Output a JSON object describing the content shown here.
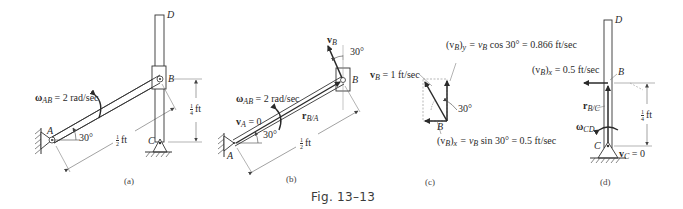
{
  "figure": {
    "caption": "Fig. 13–13",
    "panels": {
      "a": {
        "tag": "(a)",
        "point_A": "A",
        "point_B": "B",
        "point_C": "C",
        "point_D": "D",
        "omega_symbol": "ω",
        "omega_sub": "AB",
        "omega_value": " = 2 rad/sec",
        "angle": "30°",
        "length_ab_num": "1",
        "length_ab_den": "2",
        "length_ab_unit": "ft",
        "length_bc_num": "1",
        "length_bc_den": "4",
        "length_bc_unit": "ft"
      },
      "b": {
        "tag": "(b)",
        "point_A": "A",
        "point_B": "B",
        "vB_symbol": "v",
        "vB_sub": "B",
        "vB_angle": "30°",
        "omega_symbol": "ω",
        "omega_sub": "AB",
        "omega_value": " = 2 rad/sec",
        "vA_symbol": "v",
        "vA_sub": "A",
        "vA_value": " = 0",
        "r_symbol": "r",
        "r_sub": "B/A",
        "angle": "30°",
        "length_num": "1",
        "length_den": "2",
        "length_unit": "ft"
      },
      "c": {
        "tag": "(c)",
        "point_B": "B",
        "vB_symbol": "v",
        "vB_sub": "B",
        "vB_value": " = 1 ft/sec",
        "vy_symbol": "(v",
        "vy_sub": "B",
        "vy_rest": ")",
        "vy_axis": "y",
        "vy_expr": " = v",
        "vy_expr_sub": "B",
        "vy_value": " cos 30° = 0.866 ft/sec",
        "vx_symbol": "(v",
        "vx_sub": "B",
        "vx_rest": ")",
        "vx_axis": "x",
        "vx_expr": " = v",
        "vx_expr_sub": "B",
        "vx_value": " sin 30° = 0.5 ft/sec",
        "angle": "30°"
      },
      "d": {
        "tag": "(d)",
        "point_B": "B",
        "point_C": "C",
        "point_D": "D",
        "vx_symbol": "(v",
        "vx_sub": "B",
        "vx_rest": ")",
        "vx_axis": "x",
        "vx_value": " = 0.5 ft/sec",
        "r_symbol": "r",
        "r_sub": "B/C",
        "omega_symbol": "ω",
        "omega_sub": "CD",
        "vC_symbol": "v",
        "vC_sub": "C",
        "vC_value": " = 0",
        "length_num": "1",
        "length_den": "4",
        "length_unit": "ft"
      }
    }
  }
}
